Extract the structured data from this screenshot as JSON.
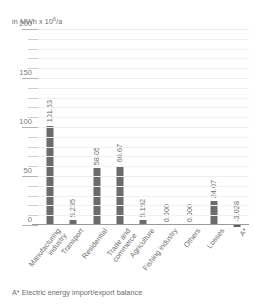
{
  "chart_data": {
    "type": "bar",
    "title": "",
    "subtitle": "",
    "unit_caption": "in MWh x 10",
    "unit_exponent": "6",
    "unit_suffix": "/a",
    "ylabel": "in MWh x 10^6/a",
    "xlabel": "",
    "ylim": [
      0,
      200
    ],
    "yticks_major": [
      0,
      50,
      100,
      150,
      200
    ],
    "ytick_labels": [
      "0",
      "50",
      "100",
      "150",
      "200"
    ],
    "ytick_minor_step": 10,
    "grid": true,
    "legend": "none",
    "categories": [
      "Manufacturing\nindustry",
      "Transport",
      "Residential",
      "Trade and\ncommerce",
      "Agriculture",
      "Fishing industry",
      "Others",
      "Losses",
      "A*"
    ],
    "values": [
      101.53,
      5.235,
      58.05,
      60.67,
      5.192,
      0.0,
      0.0,
      24.07,
      -3.028
    ],
    "value_labels": [
      "101.53",
      "5.235",
      "58.05",
      "60.67",
      "5.192",
      "0.000",
      "0.000",
      "24.07",
      "-3.028"
    ],
    "bar_color": "#6b6b6b",
    "grid_color": "#f1f1f1",
    "axis_color": "#9a9a9a",
    "text_color": "#6d6d6d"
  },
  "footnote": {
    "text": "A* Electric energy import/export balance"
  }
}
